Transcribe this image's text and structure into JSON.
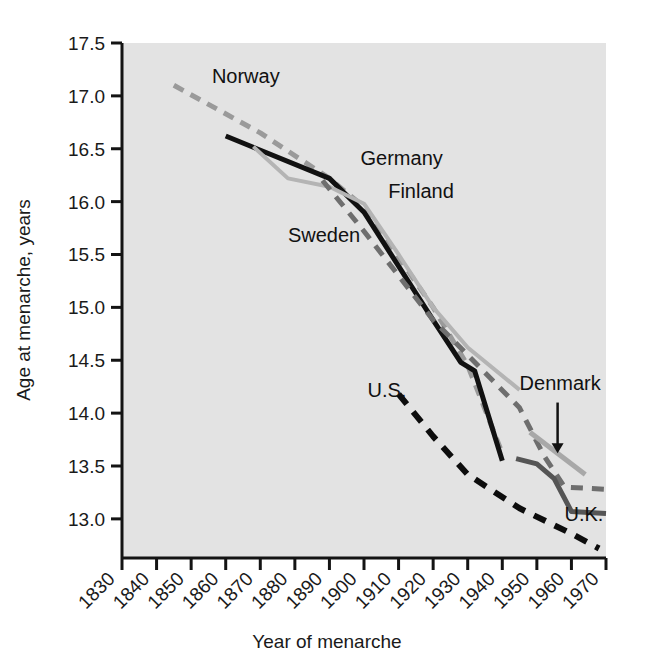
{
  "chart_data": {
    "type": "line",
    "title": "",
    "xlabel": "Year of menarche",
    "ylabel": "Age at menarche, years",
    "xlim": [
      1830,
      1970
    ],
    "ylim": [
      12.6,
      17.5
    ],
    "xticks": [
      1830,
      1840,
      1850,
      1860,
      1870,
      1880,
      1890,
      1900,
      1910,
      1920,
      1930,
      1940,
      1950,
      1960,
      1970
    ],
    "yticks": [
      13.0,
      13.5,
      14.0,
      14.5,
      15.0,
      15.5,
      16.0,
      16.5,
      17.0,
      17.5
    ],
    "grid": false,
    "legend": "inline-labels",
    "plot_background": "#e3e3e3",
    "series": [
      {
        "name": "Norway",
        "label": "Norway",
        "style": "dashed",
        "color": "#9a9a9a",
        "width": 5,
        "dash": "11,8",
        "label_x": 1856,
        "label_y": 17.12,
        "points": [
          {
            "x": 1845,
            "y": 17.1
          },
          {
            "x": 1870,
            "y": 16.65
          },
          {
            "x": 1890,
            "y": 16.22
          },
          {
            "x": 1900,
            "y": 15.95
          },
          {
            "x": 1920,
            "y": 15.0
          },
          {
            "x": 1930,
            "y": 14.45
          },
          {
            "x": 1940,
            "y": 13.62
          }
        ]
      },
      {
        "name": "Germany",
        "label": "Germany",
        "style": "solid",
        "color": "#111111",
        "width": 5,
        "dash": "none",
        "label_x": 1899,
        "label_y": 16.35,
        "points": [
          {
            "x": 1860,
            "y": 16.62
          },
          {
            "x": 1890,
            "y": 16.22
          },
          {
            "x": 1900,
            "y": 15.9
          },
          {
            "x": 1920,
            "y": 14.88
          },
          {
            "x": 1928,
            "y": 14.48
          },
          {
            "x": 1932,
            "y": 14.4
          },
          {
            "x": 1940,
            "y": 13.55
          }
        ]
      },
      {
        "name": "Finland",
        "label": "Finland",
        "style": "solid",
        "color": "#b4b4b4",
        "width": 4,
        "dash": "none",
        "label_x": 1907,
        "label_y": 16.03,
        "points": [
          {
            "x": 1868,
            "y": 16.52
          },
          {
            "x": 1878,
            "y": 16.22
          },
          {
            "x": 1890,
            "y": 16.14
          },
          {
            "x": 1900,
            "y": 15.98
          },
          {
            "x": 1910,
            "y": 15.5
          },
          {
            "x": 1920,
            "y": 15.0
          },
          {
            "x": 1930,
            "y": 14.62
          },
          {
            "x": 1945,
            "y": 14.22
          }
        ]
      },
      {
        "name": "Sweden",
        "label": "Sweden",
        "style": "dashed",
        "color": "#6e6e6e",
        "width": 5,
        "dash": "12,9",
        "label_x": 1878,
        "label_y": 15.62,
        "points": [
          {
            "x": 1888,
            "y": 16.2
          },
          {
            "x": 1900,
            "y": 15.72
          },
          {
            "x": 1910,
            "y": 15.3
          },
          {
            "x": 1920,
            "y": 14.88
          },
          {
            "x": 1930,
            "y": 14.55
          },
          {
            "x": 1945,
            "y": 14.05
          },
          {
            "x": 1952,
            "y": 13.6
          },
          {
            "x": 1958,
            "y": 13.3
          },
          {
            "x": 1970,
            "y": 13.28
          }
        ]
      },
      {
        "name": "U.S.",
        "label": "U.S.",
        "style": "dashed",
        "color": "#0d0d0d",
        "width": 6,
        "dash": "13,10",
        "label_x": 1901,
        "label_y": 14.15,
        "points": [
          {
            "x": 1910,
            "y": 14.18
          },
          {
            "x": 1920,
            "y": 13.78
          },
          {
            "x": 1930,
            "y": 13.42
          },
          {
            "x": 1945,
            "y": 13.1
          },
          {
            "x": 1960,
            "y": 12.86
          },
          {
            "x": 1968,
            "y": 12.72
          }
        ]
      },
      {
        "name": "Denmark",
        "label": "Denmark",
        "style": "solid",
        "color": "#a8a8a8",
        "width": 5,
        "dash": "none",
        "label_x": 1945,
        "label_y": 14.22,
        "points": [
          {
            "x": 1948,
            "y": 13.82
          },
          {
            "x": 1964,
            "y": 13.42
          }
        ]
      },
      {
        "name": "U.K.",
        "label": "U.K.",
        "style": "solid",
        "color": "#555555",
        "width": 5,
        "dash": "none",
        "label_x": 1958,
        "label_y": 12.98,
        "points": [
          {
            "x": 1944,
            "y": 13.57
          },
          {
            "x": 1950,
            "y": 13.52
          },
          {
            "x": 1955,
            "y": 13.38
          },
          {
            "x": 1960,
            "y": 13.07
          },
          {
            "x": 1970,
            "y": 13.05
          }
        ]
      }
    ],
    "annotations": [
      {
        "name": "denmark-arrow",
        "type": "arrow",
        "x": 1956,
        "y_from": 14.1,
        "y_to": 13.62
      }
    ]
  }
}
